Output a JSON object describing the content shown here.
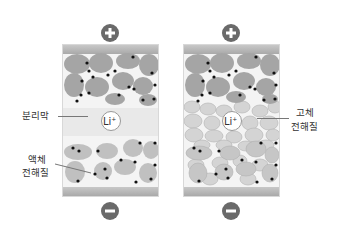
{
  "diagram": {
    "type": "battery-comparison",
    "left_cell": {
      "name": "liquid-electrolyte-battery",
      "ion_label": "Li",
      "ion_superscript": "+",
      "separator_label": "분리막",
      "electrolyte_label_line1": "액체",
      "electrolyte_label_line2": "전해질"
    },
    "right_cell": {
      "name": "solid-state-battery",
      "ion_label": "Li",
      "ion_superscript": "+",
      "electrolyte_label_line1": "고체",
      "electrolyte_label_line2": "전해질"
    },
    "terminals": {
      "positive": "+",
      "negative": "−"
    },
    "colors": {
      "terminal": "#6a6a6a",
      "particle_dark": "#a3a3a3",
      "particle_light": "#d6d6d6",
      "dot": "#111111",
      "collector": "#b5b5b5"
    }
  }
}
